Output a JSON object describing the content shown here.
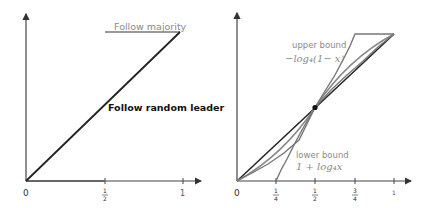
{
  "left_panel": {
    "labels": {
      "follow_majority": "Follow majority",
      "follow_random_leader": "Follow random leader"
    },
    "x_ticks": [
      {
        "label": "0",
        "value": 0
      },
      {
        "num": "1",
        "den": "2",
        "value": 0.5
      },
      {
        "label": "1",
        "value": 1
      }
    ]
  },
  "right_panel": {
    "labels": {
      "upper_bound_title": "upper bound",
      "upper_bound_formula": "−log₄(1− x)",
      "lower_bound_title": "lower bound",
      "lower_bound_formula": "1 + log₄x"
    },
    "x_ticks": [
      {
        "label": "0",
        "value": 0
      },
      {
        "num": "1",
        "den": "4",
        "value": 0.25
      },
      {
        "num": "1",
        "den": "2",
        "value": 0.5
      },
      {
        "num": "3",
        "den": "4",
        "value": 0.75
      },
      {
        "label": "1",
        "value": 1
      }
    ],
    "marked_point": {
      "x": 0.5,
      "y": 0.5
    }
  },
  "colors": {
    "axis": "#333333",
    "dark_line": "#222222",
    "gray_line": "#7a7a7a",
    "gray_text": "#8a8a8a",
    "dark_text": "#111111"
  }
}
